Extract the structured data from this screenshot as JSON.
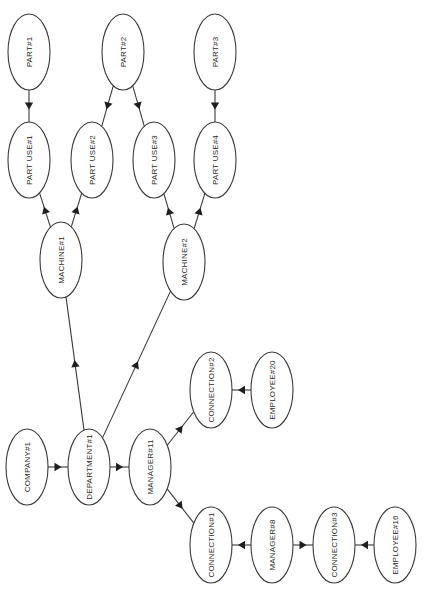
{
  "diagram": {
    "type": "entity-instance graph (rotated 90°)",
    "nodes": [
      {
        "id": "part1",
        "label": "PART#1",
        "cx": 29,
        "cy": 52
      },
      {
        "id": "part2",
        "label": "PART#2",
        "cx": 123,
        "cy": 52
      },
      {
        "id": "part3",
        "label": "PART#3",
        "cx": 215,
        "cy": 52
      },
      {
        "id": "partuse1",
        "label": "PART USE#1",
        "cx": 29,
        "cy": 160
      },
      {
        "id": "partuse2",
        "label": "PART USE#2",
        "cx": 92,
        "cy": 160
      },
      {
        "id": "partuse3",
        "label": "PART USE#3",
        "cx": 154,
        "cy": 160
      },
      {
        "id": "partuse4",
        "label": "PART USE#4",
        "cx": 215,
        "cy": 160
      },
      {
        "id": "machine1",
        "label": "MACHINE#1",
        "cx": 61,
        "cy": 260
      },
      {
        "id": "machine2",
        "label": "MACHINE#2",
        "cx": 184,
        "cy": 262
      },
      {
        "id": "company1",
        "label": "COMPANY#1",
        "cx": 27,
        "cy": 467
      },
      {
        "id": "department1",
        "label": "DEPARTMENT#1",
        "cx": 89,
        "cy": 467
      },
      {
        "id": "manager11",
        "label": "MANAGER#11",
        "cx": 150,
        "cy": 467
      },
      {
        "id": "connection2",
        "label": "CONNECTION#2",
        "cx": 211,
        "cy": 390
      },
      {
        "id": "employee20",
        "label": "EMPLOYEE#20",
        "cx": 272,
        "cy": 390
      },
      {
        "id": "connection1",
        "label": "CONNECTION#1",
        "cx": 211,
        "cy": 545
      },
      {
        "id": "manager8",
        "label": "MANAGER#8",
        "cx": 272,
        "cy": 545
      },
      {
        "id": "connection3",
        "label": "CONNECTION#3",
        "cx": 334,
        "cy": 545
      },
      {
        "id": "employee16",
        "label": "EMPLOYEE#16",
        "cx": 395,
        "cy": 545
      }
    ],
    "edges": [
      {
        "from": "part1",
        "to": "partuse1"
      },
      {
        "from": "part2",
        "to": "partuse2"
      },
      {
        "from": "part2",
        "to": "partuse3"
      },
      {
        "from": "part3",
        "to": "partuse4"
      },
      {
        "from": "machine1",
        "to": "partuse1"
      },
      {
        "from": "machine1",
        "to": "partuse2"
      },
      {
        "from": "machine2",
        "to": "partuse3"
      },
      {
        "from": "machine2",
        "to": "partuse4"
      },
      {
        "from": "department1",
        "to": "machine1"
      },
      {
        "from": "department1",
        "to": "machine2"
      },
      {
        "from": "company1",
        "to": "department1"
      },
      {
        "from": "department1",
        "to": "manager11"
      },
      {
        "from": "manager11",
        "to": "connection2"
      },
      {
        "from": "manager11",
        "to": "connection1"
      },
      {
        "from": "employee20",
        "to": "connection2"
      },
      {
        "from": "manager8",
        "to": "connection1"
      },
      {
        "from": "manager8",
        "to": "connection3"
      },
      {
        "from": "employee16",
        "to": "connection3"
      }
    ],
    "node_rx": 21,
    "node_ry": 38,
    "colors": {
      "stroke": "#3a3a3a",
      "arrow": "#1e1e1e",
      "text": "#2a2a2a",
      "background": "#ffffff"
    }
  }
}
